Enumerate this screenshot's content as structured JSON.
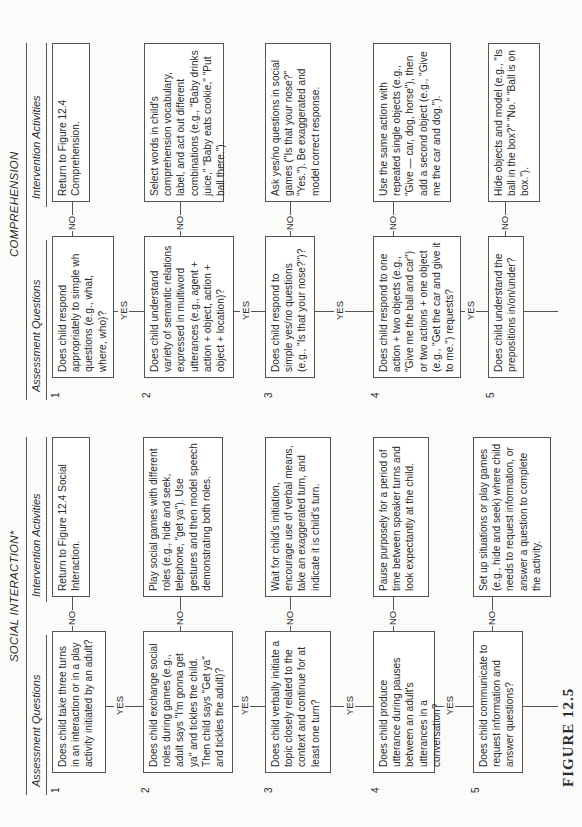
{
  "figure_label": "FIGURE 12.5",
  "sections": [
    {
      "title": "SOCIAL INTERACTION*",
      "col_assessment": "Assessment Questions",
      "col_intervention": "Intervention Activities",
      "yes_label": "YES",
      "no_label": "NO",
      "rows": [
        {
          "num": "1",
          "question": "Does child take three turns in an interaction or in a play activity initiated by an adult?",
          "activity": "Return to Figure 12.4 Social Interaction."
        },
        {
          "num": "2",
          "question": "Does child exchange social roles during games (e.g., adult says \"I'm gonna get ya\" and tickles the child. Then child says \"Get ya\" and tickles the adult)?",
          "activity": "Play social games with different roles (e.g., hide and seek, telephone, \"get ya\"). Use gestures and then model speech demonstrating both roles."
        },
        {
          "num": "3",
          "question": "Does child verbally initiate a topic closely related to the context and continue for at least one turn?",
          "activity": "Wait for child's initiation, encourage use of verbal means, take an exaggerated turn, and indicate it is child's turn."
        },
        {
          "num": "4",
          "question": "Does child produce utterance during pauses between an adult's utterances in a conversation?",
          "activity": "Pause purposely for a period of time between speaker turns and look expectantly at the child."
        },
        {
          "num": "5",
          "question": "Does child communicate to request information and answer questions?",
          "activity": "Set up situations or play games (e.g., hide and seek) where child needs to request information, or answer a question to complete the activity."
        }
      ]
    },
    {
      "title": "COMPREHENSION",
      "col_assessment": "Assessment Questions",
      "col_intervention": "Intervention Activities",
      "yes_label": "YES",
      "no_label": "NO",
      "rows": [
        {
          "num": "1",
          "question": "Does child respond appropriately to simple wh questions (e.g., what, where, who)?",
          "activity": "Return to Figure 12.4 Comprehension."
        },
        {
          "num": "2",
          "question": "Does child understand variety of semantic relations expressed in multiword utterances (e.g., agent + action + object, action + object + location)?",
          "activity": "Select words in child's comprehension vocabulary, label, and act out different combinations (e.g., \"Baby drinks juice,\" \"Baby eats cookie,\" \"Put ball there.\")."
        },
        {
          "num": "3",
          "question": "Does child respond to simple yes/no questions (e.g., \"Is that your nose?\")?",
          "activity": "Ask yes/no questions in social games (\"Is that your nose?\" \"Yes.\"). Be exaggerated and model correct response."
        },
        {
          "num": "4",
          "question": "Does child respond to one action + two objects (e.g., \"Give me the ball and car\") or two actions + one object (e.g., \"Get the car and give it to me.\") requests?",
          "activity": "Use the same action with repeated single objects (e.g., \"Give — car, dog, horse\"), then add a second object (e.g., \"Give me the car and dog.\")."
        },
        {
          "num": "5",
          "question": "Does child understand the prepositions in/on/under?",
          "activity": "Hide objects and model (e.g., \"Is ball in the box?\" \"No.\" \"Ball is on box.\")."
        }
      ]
    }
  ]
}
